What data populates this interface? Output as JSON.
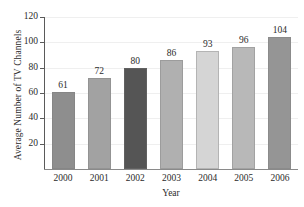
{
  "chart_data": {
    "type": "bar",
    "title": "",
    "xlabel": "Year",
    "ylabel": "Average Number of TV Channels",
    "categories": [
      "2000",
      "2001",
      "2002",
      "2003",
      "2004",
      "2005",
      "2006"
    ],
    "values": [
      61,
      72,
      80,
      86,
      93,
      96,
      104
    ],
    "value_labels": [
      "61",
      "72",
      "80",
      "86",
      "93",
      "96",
      "104"
    ],
    "bar_colors": [
      "#8e8e8e",
      "#a2a2a2",
      "#555555",
      "#b0b0b0",
      "#d5d5d5",
      "#b8b8b8",
      "#959595"
    ],
    "ylim": [
      0,
      120
    ],
    "yticks": [
      20,
      40,
      60,
      80,
      100,
      120
    ],
    "ytick_labels": [
      "20",
      "40",
      "60",
      "80",
      "100",
      "120"
    ],
    "grid": true,
    "grid_axis": "y",
    "legend": null,
    "series": [
      {
        "name": "Average Number of TV Channels",
        "values": [
          61,
          72,
          80,
          86,
          93,
          96,
          104
        ]
      }
    ]
  },
  "figure": {
    "title_ghost": "",
    "background": "#ffffff",
    "axis_color": "#5a5a5a",
    "grid_color": "#efefef"
  }
}
